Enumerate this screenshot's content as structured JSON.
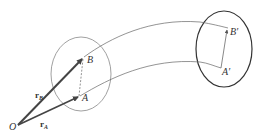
{
  "diagram": {
    "points": {
      "O": {
        "label": "O"
      },
      "A": {
        "label": "A"
      },
      "B": {
        "label": "B"
      },
      "A_prime": {
        "label": "A′"
      },
      "B_prime": {
        "label": "B′"
      }
    },
    "vectors": {
      "rA": {
        "label": "r",
        "subscript": "A"
      },
      "rB": {
        "label": "r",
        "subscript": "B"
      }
    },
    "colors": {
      "stroke": "#555555",
      "vector": "#444444",
      "body_initial": "#888888",
      "body_final": "#333333"
    }
  }
}
